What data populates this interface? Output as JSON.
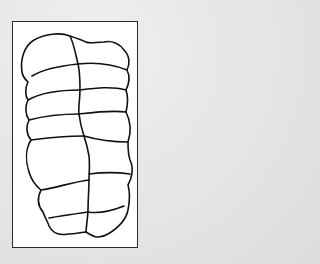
{
  "figure": {
    "colors": {
      "background": "#e6e6e4",
      "frame_fill": "#ffffff",
      "frame_border": "#2a2a2a",
      "stroke": "#111111"
    },
    "segments_left": 7,
    "segments_right": 7
  }
}
